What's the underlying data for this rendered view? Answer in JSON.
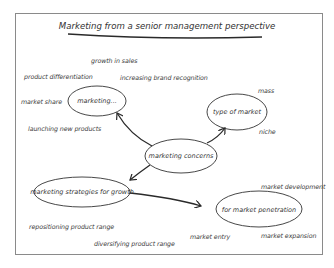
{
  "title": "Marketing from a senior management perspective",
  "nodes": {
    "center": "marketing concerns",
    "marketing": "marketing...",
    "type_of_market": "type of market",
    "strategies": "marketing strategies for growth",
    "penetration": "for market penetration"
  },
  "labels": {
    "growth_in_sales": "growth in sales",
    "product_differentiation": "product differentiation",
    "increasing_brand_recognition": "increasing brand recognition",
    "market_share": "market share",
    "launching_new_products": "launching new products",
    "mass": "mass",
    "niche": "niche",
    "market_development": "market development",
    "repositioning_product_range": "repositioning product range",
    "diversifying_product_range": "diversifying product range",
    "market_entry": "market entry",
    "market_expansion": "market expansion"
  },
  "edges": [
    {
      "from": "marketing concerns",
      "to": "marketing..."
    },
    {
      "from": "marketing concerns",
      "to": "type of market"
    },
    {
      "from": "marketing concerns",
      "to": "marketing strategies for growth"
    },
    {
      "from": "marketing strategies for growth",
      "to": "for market penetration"
    }
  ]
}
